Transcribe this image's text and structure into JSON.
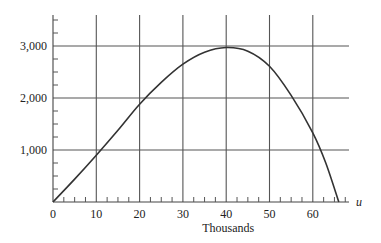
{
  "chart_data": {
    "type": "line",
    "title": "",
    "xlabel": "Thousands",
    "axis_var": "u",
    "ylabel": "",
    "xlim": [
      0,
      68
    ],
    "ylim": [
      0,
      3600
    ],
    "x_ticks": [
      0,
      10,
      20,
      30,
      40,
      50,
      60
    ],
    "x_tick_labels": [
      "0",
      "10",
      "20",
      "30",
      "40",
      "50",
      "60"
    ],
    "y_ticks": [
      1000,
      2000,
      3000
    ],
    "y_tick_labels": [
      "1,000",
      "2,000",
      "3,000"
    ],
    "grid": true,
    "legend": null,
    "series": [
      {
        "name": "curve",
        "x": [
          0,
          5,
          10,
          15,
          20,
          25,
          30,
          35,
          40,
          45,
          50,
          55,
          60,
          63,
          66
        ],
        "y": [
          0,
          440,
          900,
          1380,
          1880,
          2300,
          2650,
          2880,
          2970,
          2900,
          2610,
          2050,
          1330,
          750,
          0
        ]
      }
    ]
  }
}
